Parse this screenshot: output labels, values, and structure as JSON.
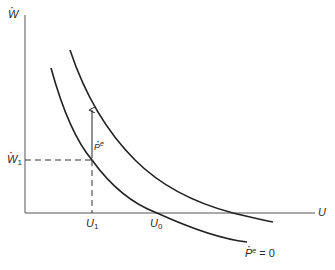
{
  "diagram": {
    "type": "expectations-augmented Phillips curve",
    "y_axis_label": "W",
    "x_axis_label": "U",
    "y_tick_label": {
      "base": "W",
      "sub": "1"
    },
    "x_tick_labels": [
      {
        "base": "U",
        "sub": "1"
      },
      {
        "base": "U",
        "sub": "0"
      }
    ],
    "arrow_label": {
      "base": "P",
      "sup": "e"
    },
    "curve_label": {
      "base": "P",
      "sup": "e",
      "suffix": " = 0"
    },
    "colors": {
      "line": "#222222",
      "axis": "#555555",
      "background": "#ffffff"
    }
  }
}
